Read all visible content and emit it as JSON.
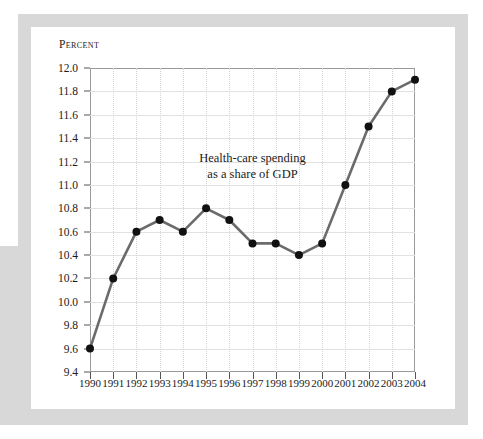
{
  "chart_data": {
    "type": "line",
    "title": "",
    "annotation": [
      "Health-care spending",
      "as a share of GDP"
    ],
    "xlabel": "",
    "ylabel": "Percent",
    "categories": [
      1990,
      1991,
      1992,
      1993,
      1994,
      1995,
      1996,
      1997,
      1998,
      1999,
      2000,
      2001,
      2002,
      2003,
      2004
    ],
    "xtick_labels": [
      "1990",
      "1991",
      "1992",
      "1993",
      "1994",
      "1995",
      "1996",
      "1997",
      "1998",
      "1999",
      "2000",
      "2001",
      "2002",
      "2003",
      "2004"
    ],
    "values": [
      9.6,
      10.2,
      10.6,
      10.7,
      10.6,
      10.8,
      10.7,
      10.5,
      10.5,
      10.4,
      10.5,
      11.0,
      11.5,
      11.8,
      11.9
    ],
    "ylim": [
      9.4,
      12.0
    ],
    "ytick_labels": [
      "12.0",
      "11.8",
      "11.6",
      "11.4",
      "11.2",
      "11.0",
      "10.8",
      "10.6",
      "10.4",
      "10.2",
      "10.0",
      "9.8",
      "9.6",
      "9.4"
    ],
    "ytick_values": [
      12.0,
      11.8,
      11.6,
      11.4,
      11.2,
      11.0,
      10.8,
      10.6,
      10.4,
      10.2,
      10.0,
      9.8,
      9.6,
      9.4
    ],
    "grid": true,
    "legend": "none",
    "line_color": "#6b6b6b",
    "marker_color": "#111111"
  }
}
